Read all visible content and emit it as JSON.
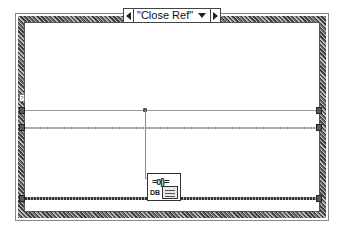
{
  "case_structure": {
    "selector_label": "\"Close Ref\"",
    "prev_case_icon": "triangle-left-icon",
    "next_case_icon": "triangle-right-icon",
    "dropdown_icon": "triangle-down-icon"
  },
  "node": {
    "name": "Close Reference",
    "connector_glyph": "=0|}=",
    "db_label": "DB"
  },
  "tunnel_flag": "?"
}
